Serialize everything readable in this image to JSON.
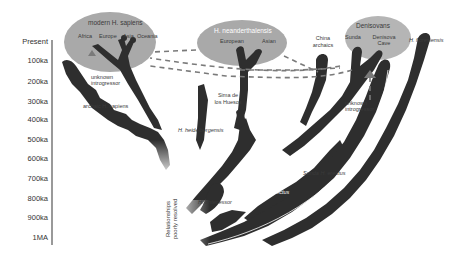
{
  "axis": {
    "ticks": [
      "Present",
      "100ka",
      "200ka",
      "300ka",
      "400ka",
      "500ka",
      "600ka",
      "700ka",
      "800ka",
      "900ka",
      "1MA"
    ]
  },
  "groups": {
    "sapiens": {
      "title": "modern H. sapiens",
      "members": [
        "Africa",
        "Europe",
        "Asia",
        "Oceania"
      ]
    },
    "neanderthal": {
      "title": "H. neanderthalensis",
      "members": [
        "European",
        "Asian"
      ]
    },
    "denisovan": {
      "title": "Denisovans",
      "members": [
        "Sunda",
        "Denisova Cave"
      ]
    }
  },
  "labels": {
    "china_archaics": "China archaics",
    "china_line1": "China",
    "china_line2": "archaics",
    "floresiensis": "H. floresiensis",
    "unknown_intro_1_l1": "unknown",
    "unknown_intro_1_l2": "introgressor",
    "unknown_intro_2_l1": "unknown",
    "unknown_intro_2_l2": "introgressor",
    "archaic_sapiens": "archaic H. sapiens",
    "sima_l1": "Sima de",
    "sima_l2": "los Huesos",
    "heidelbergensis": "H. heidelbergensis",
    "antecessor": "H. antecessor",
    "asian_erectus": "Asian H. erectus",
    "sunda_erectus": "Sunda H. erectus",
    "relationships_l1": "Relationships",
    "relationships_l2": "poorly resolved"
  },
  "colors": {
    "branch": "#2e2e2e",
    "ellipse": "#a9a9a9",
    "dash": "#7a7a7a",
    "axis": "#555555"
  }
}
